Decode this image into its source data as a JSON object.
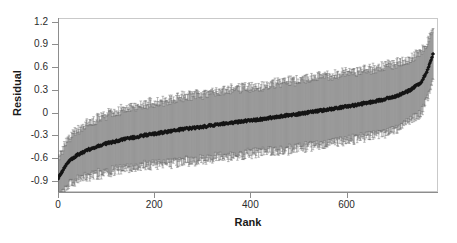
{
  "chart_data": {
    "type": "scatter",
    "title": "",
    "subtitle": "",
    "xlabel": "Rank",
    "ylabel": "Residual",
    "xlim": [
      0,
      790
    ],
    "ylim": [
      -1.05,
      1.25
    ],
    "xticks": [
      0,
      200,
      400,
      600
    ],
    "yticks": [
      1.2,
      0.9,
      0.6,
      0.3,
      0,
      -0.3,
      -0.6,
      -0.9
    ],
    "xticklabels": [
      "0",
      "200",
      "400",
      "600"
    ],
    "yticklabels": [
      "1.2",
      "0.9",
      "0.6",
      "0.3",
      "0",
      "-0.3",
      "-0.6",
      "-0.9"
    ],
    "grid": false,
    "legend": null,
    "n_points": 780,
    "marker": "diamond",
    "marker_color": "#141414",
    "errorbar_color": "#6a6a6a",
    "errorbar_caps": true,
    "series": [
      {
        "name": "Residual",
        "x": [
          1,
          20,
          40,
          60,
          80,
          100,
          140,
          180,
          220,
          260,
          300,
          340,
          380,
          420,
          460,
          500,
          540,
          580,
          620,
          660,
          700,
          730,
          755,
          768,
          775,
          780
        ],
        "values": [
          -0.86,
          -0.66,
          -0.56,
          -0.5,
          -0.45,
          -0.41,
          -0.35,
          -0.3,
          -0.26,
          -0.22,
          -0.19,
          -0.15,
          -0.12,
          -0.09,
          -0.05,
          -0.02,
          0.02,
          0.06,
          0.1,
          0.15,
          0.21,
          0.29,
          0.4,
          0.56,
          0.68,
          0.78
        ],
        "errors": [
          0.28,
          0.3,
          0.33,
          0.35,
          0.37,
          0.38,
          0.4,
          0.41,
          0.42,
          0.43,
          0.43,
          0.44,
          0.44,
          0.44,
          0.45,
          0.45,
          0.45,
          0.45,
          0.45,
          0.44,
          0.44,
          0.42,
          0.4,
          0.38,
          0.34,
          0.3
        ]
      }
    ]
  },
  "axes": {
    "ylabel": "Residual",
    "xlabel": "Rank"
  }
}
